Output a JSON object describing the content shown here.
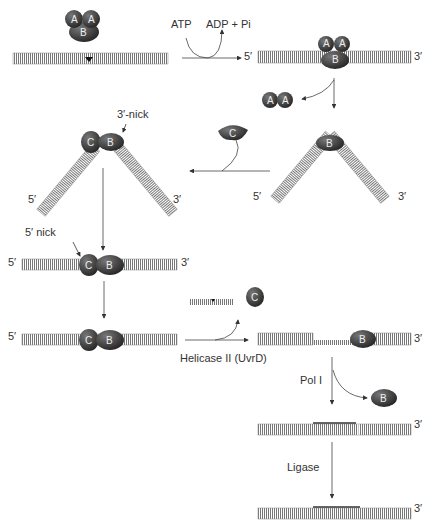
{
  "labels": {
    "atp": "ATP",
    "adp_pi": "ADP + Pi",
    "five_prime": "5′",
    "three_prime": "3′",
    "three_nick": "3′-nick",
    "five_nick": "5′ nick",
    "helicase": "Helicase II (UvrD)",
    "pol": "Pol I",
    "ligase": "Ligase"
  },
  "proteins": {
    "a": "A",
    "b": "B",
    "c": "C"
  },
  "colors": {
    "protein": "#3a3a3a",
    "dna": "#777777",
    "arrow": "#444444"
  }
}
